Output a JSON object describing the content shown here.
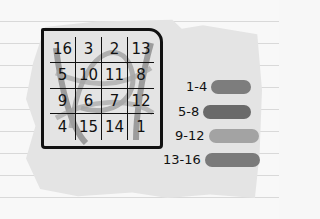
{
  "magic_square": {
    "cells": [
      [
        "16",
        "3",
        "2",
        "13"
      ],
      [
        "5",
        "10",
        "11",
        "8"
      ],
      [
        "9",
        "6",
        "7",
        "12"
      ],
      [
        "4",
        "15",
        "14",
        "1"
      ]
    ]
  },
  "legend": [
    {
      "label": "1-4",
      "color": "#7d7d7d"
    },
    {
      "label": "5-8",
      "color": "#6a6a6a"
    },
    {
      "label": "9-12",
      "color": "#a3a3a3"
    },
    {
      "label": "13-16",
      "color": "#7a7a7a"
    }
  ]
}
